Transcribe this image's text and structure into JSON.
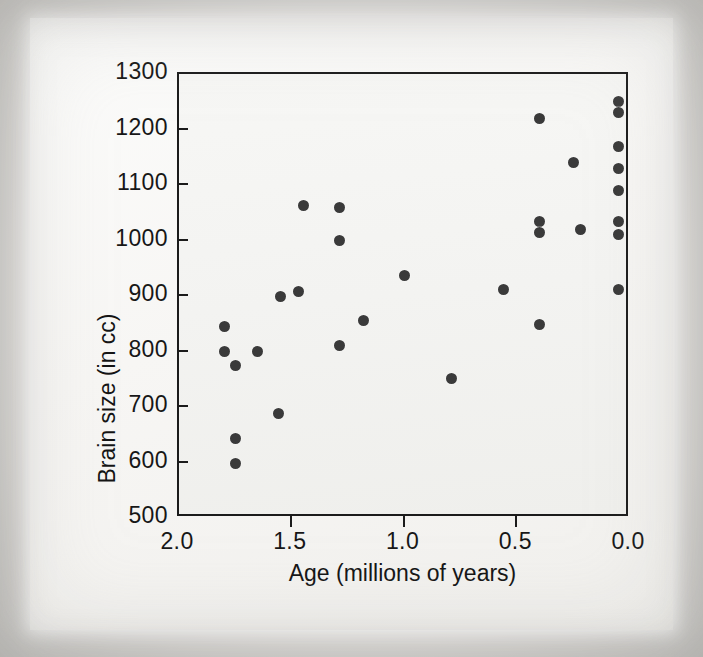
{
  "chart_data": {
    "type": "scatter",
    "title": "",
    "xlabel": "Age (millions of years)",
    "ylabel": "Brain size (in cc)",
    "xlim": [
      2.0,
      0.0
    ],
    "xaxis_reversed": true,
    "ylim": [
      500,
      1300
    ],
    "grid": false,
    "legend": null,
    "xticks": [
      "2.0",
      "1.5",
      "1.0",
      "0.5",
      "0.0"
    ],
    "xtick_values": [
      2.0,
      1.5,
      1.0,
      0.5,
      0.0
    ],
    "yticks": [
      "1300",
      "1200",
      "1100",
      "1000",
      "900",
      "800",
      "700",
      "600",
      "500"
    ],
    "ytick_values": [
      1300,
      1200,
      1100,
      1000,
      900,
      800,
      700,
      600,
      500
    ],
    "marker": {
      "shape": "circle",
      "color": "#3a3a3a",
      "size": 11
    },
    "n_points": 33,
    "points": [
      {
        "x": 1.8,
        "y": 845
      },
      {
        "x": 1.8,
        "y": 800
      },
      {
        "x": 1.75,
        "y": 775
      },
      {
        "x": 1.75,
        "y": 643
      },
      {
        "x": 1.75,
        "y": 598
      },
      {
        "x": 1.65,
        "y": 800
      },
      {
        "x": 1.56,
        "y": 688
      },
      {
        "x": 1.55,
        "y": 900
      },
      {
        "x": 1.47,
        "y": 908
      },
      {
        "x": 1.45,
        "y": 1063
      },
      {
        "x": 1.29,
        "y": 1060
      },
      {
        "x": 1.29,
        "y": 1000
      },
      {
        "x": 1.29,
        "y": 810
      },
      {
        "x": 1.18,
        "y": 855
      },
      {
        "x": 1.0,
        "y": 937
      },
      {
        "x": 0.79,
        "y": 752
      },
      {
        "x": 0.56,
        "y": 912
      },
      {
        "x": 0.4,
        "y": 1220
      },
      {
        "x": 0.4,
        "y": 1035
      },
      {
        "x": 0.4,
        "y": 1015
      },
      {
        "x": 0.4,
        "y": 848
      },
      {
        "x": 0.25,
        "y": 1140
      },
      {
        "x": 0.22,
        "y": 1020
      },
      {
        "x": 0.05,
        "y": 1250
      },
      {
        "x": 0.05,
        "y": 1230
      },
      {
        "x": 0.05,
        "y": 1170
      },
      {
        "x": 0.05,
        "y": 1130
      },
      {
        "x": 0.05,
        "y": 1090
      },
      {
        "x": 0.05,
        "y": 1035
      },
      {
        "x": 0.05,
        "y": 1010
      },
      {
        "x": 0.05,
        "y": 912
      }
    ]
  },
  "axes": {
    "y_title": "Brain size (in cc)",
    "x_title": "Age (millions of years)"
  }
}
